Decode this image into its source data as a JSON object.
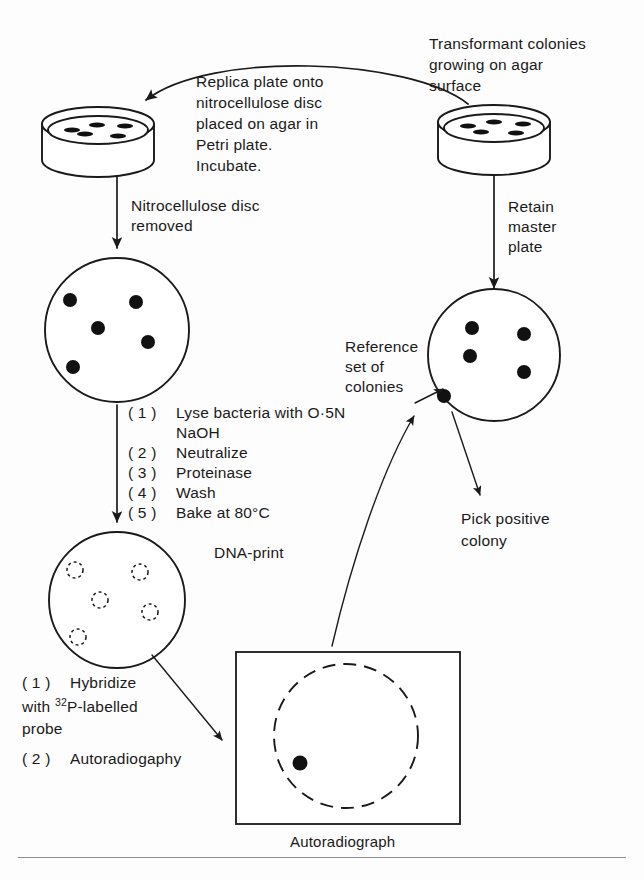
{
  "figure": {
    "domain": "diagram",
    "background_color": "#fdfdfd",
    "ink_color": "#1a1a1a"
  },
  "labels": {
    "replica_plate": {
      "lines": [
        "Replica plate onto",
        "nitrocellulose disc",
        "placed on agar in",
        "Petri plate.",
        "Incubate."
      ]
    },
    "transformant_colonies": {
      "lines": [
        "Transformant colonies",
        "growing on agar",
        "surface"
      ]
    },
    "nitrocellulose_removed": {
      "lines": [
        "Nitrocellulose disc",
        "removed"
      ]
    },
    "retain_master_plate": {
      "lines": [
        "Retain",
        "master",
        "plate"
      ]
    },
    "reference_set": {
      "lines": [
        "Reference",
        "set of",
        "colonies"
      ]
    },
    "pick_positive": {
      "lines": [
        "Pick positive",
        "colony"
      ]
    },
    "dna_print": {
      "text": "DNA-print"
    },
    "autoradiograph": {
      "text": "Autoradiograph"
    }
  },
  "processing_steps": {
    "items": [
      {
        "number": "( 1 )",
        "text": "Lyse bacteria with O·5N",
        "continuation": "NaOH"
      },
      {
        "number": "( 2 )",
        "text": "Neutralize",
        "continuation": ""
      },
      {
        "number": "( 3 )",
        "text": "Proteinase",
        "continuation": ""
      },
      {
        "number": "( 4 )",
        "text": "Wash",
        "continuation": ""
      },
      {
        "number": "( 5 )",
        "text": "Bake at 80°C",
        "continuation": ""
      }
    ]
  },
  "hybridization_steps": {
    "items": [
      {
        "number": "( 1 )",
        "text": "Hybridize"
      },
      {
        "number": "",
        "text_prefix": "with ",
        "isotope": "32",
        "text_suffix": "P-labelled"
      },
      {
        "number": "",
        "text": "probe"
      },
      {
        "number": "( 2 )",
        "text": "Autoradiogaphy"
      }
    ],
    "line1_number": "( 1 )",
    "line1_text": "Hybridize",
    "line2_prefix": "with ",
    "line2_isotope": "32",
    "line2_suffix": "P-labelled",
    "line3_text": "probe",
    "line4_number": "( 2 )",
    "line4_text": "Autoradiogaphy"
  },
  "objects": {
    "master_petri_dish": {
      "name": "Master Petri plate",
      "colony_count": 5,
      "view": "3d-perspective"
    },
    "replica_petri_dish": {
      "name": "Replica Petri plate with nitrocellulose disc",
      "colony_count": 5,
      "view": "3d-perspective"
    },
    "nitrocellulose_disc": {
      "name": "Nitrocellulose disc with colonies",
      "colony_count": 5,
      "view": "flat-circle"
    },
    "master_plate_top": {
      "name": "Reference set of colonies",
      "colony_count": 5,
      "view": "flat-circle"
    },
    "dna_print_disc": {
      "name": "DNA-print disc",
      "spot_count": 5,
      "view": "flat-circle-dashed-spots"
    },
    "autoradiograph_film": {
      "name": "Autoradiograph film",
      "positive_signals": 1,
      "view": "rectangle-with-dashed-circle"
    }
  }
}
